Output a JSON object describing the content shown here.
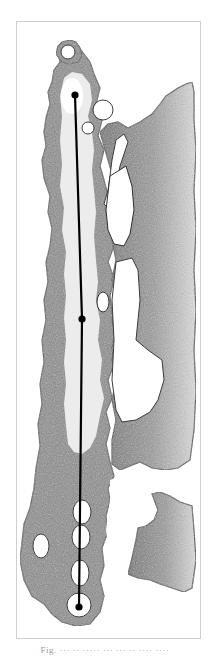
{
  "figure": {
    "frame": {
      "x": 16,
      "y": 21,
      "width": 185,
      "height": 618,
      "border_color": "#cfcfcf"
    },
    "colors": {
      "tissue_dark": "#5a5a5a",
      "tissue_mid": "#8c8c8c",
      "tissue_light": "#bdbdbd",
      "lumen": "#ededed",
      "hole": "#ffffff",
      "measure_line": "#000000"
    },
    "measurement": {
      "points": [
        {
          "label": "top",
          "x": 75,
          "y": 95
        },
        {
          "label": "middle",
          "x": 82,
          "y": 319
        },
        {
          "label": "bottom",
          "x": 79,
          "y": 607
        }
      ]
    },
    "caption": "Fig. ··· ·· ····· ··· ··· ·· ···· ····"
  }
}
